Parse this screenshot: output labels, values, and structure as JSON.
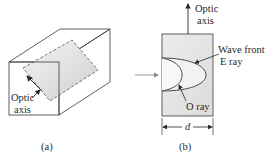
{
  "figure_a": {
    "caption": "(a)",
    "label_optic_line1": "Optic",
    "label_optic_line2": "axis"
  },
  "figure_b": {
    "caption": "(b)",
    "label_optic_line1": "Optic",
    "label_optic_line2": "axis",
    "label_wavefront_line1": "Wave front",
    "label_wavefront_line2": "E ray",
    "label_oray": "O ray",
    "label_thickness": "d"
  },
  "colors": {
    "stroke": "#3a3a3a",
    "crystal_fill": "#e6e6e6",
    "plane_fill": "#d8d8d8",
    "arrow_in": "#8a8a8a"
  }
}
